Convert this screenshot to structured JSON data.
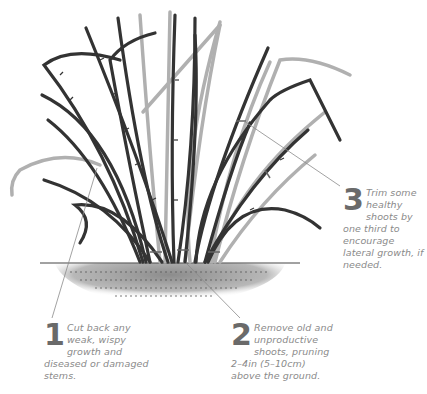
{
  "illustration": {
    "subject": "bramble-bush-pruning",
    "colors": {
      "stem_dark": "#3a3a3a",
      "stem_light": "#b0b0b0",
      "soil": "#9a9a9a",
      "leader_line": "#8a8a8a",
      "text": "#8a8a8a",
      "number": "#6a6a6a"
    }
  },
  "callouts": [
    {
      "number": "1",
      "text": "Cut back any weak, wispy growth and diseased or damaged stems."
    },
    {
      "number": "2",
      "text": "Remove old and unproductive shoots, pruning 2–4in (5–10cm) above the ground."
    },
    {
      "number": "3",
      "text": "Trim some healthy shoots by one third to encourage lateral growth, if needed."
    }
  ]
}
